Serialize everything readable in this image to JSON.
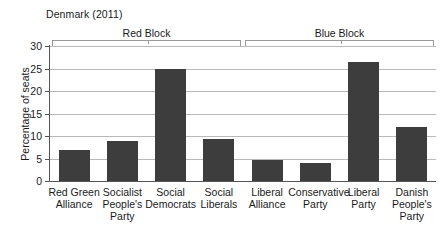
{
  "chart_data": {
    "type": "bar",
    "title": "Denmark (2011)",
    "xlabel": "",
    "ylabel": "Percentage of seats",
    "ylim": [
      0,
      30
    ],
    "yticks": [
      0,
      5,
      10,
      15,
      20,
      25,
      30
    ],
    "grid": true,
    "legend": null,
    "categories": [
      "Red Green Alliance",
      "Socialist People's Party",
      "Social Democrats",
      "Social Liberals",
      "Liberal Alliance",
      "Conservative Party",
      "Liberal Party",
      "Danish People's Party"
    ],
    "category_lines": [
      [
        "Red Green",
        "Alliance"
      ],
      [
        "Socialist",
        "People's",
        "Party"
      ],
      [
        "Social",
        "Democrats"
      ],
      [
        "Social",
        "Liberals"
      ],
      [
        "Liberal",
        "Alliance"
      ],
      [
        "Conservative",
        "Party"
      ],
      [
        "Liberal",
        "Party"
      ],
      [
        "Danish",
        "People's",
        "Party"
      ]
    ],
    "values": [
      6.8,
      8.8,
      25.0,
      9.3,
      4.7,
      3.9,
      26.5,
      11.9
    ],
    "bar_color": "#3d3d3d",
    "annotations": [
      {
        "label": "Red Block",
        "covers": [
          0,
          3
        ]
      },
      {
        "label": "Blue Block",
        "covers": [
          4,
          7
        ]
      }
    ]
  },
  "axis": {
    "ytick_labels": [
      "0",
      "5",
      "10",
      "15",
      "20",
      "25",
      "30"
    ]
  },
  "brackets": {
    "red_label": "Red Block",
    "blue_label": "Blue Block"
  }
}
